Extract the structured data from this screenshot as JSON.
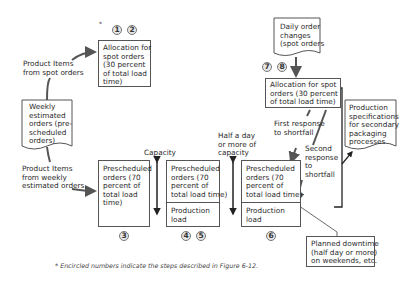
{
  "diagram": {
    "asterisk": "*",
    "steps": {
      "s1": "1",
      "s2": "2",
      "s3": "3",
      "s4": "4",
      "s5": "5",
      "s6": "6",
      "s7": "7",
      "s8": "8"
    },
    "alloc_left": "Allocation for\nspot orders\n(30 percent\nof total load\ntime)",
    "product_spot_label": "Product Items\nfrom spot orders",
    "weekly_doc": "Weekly\nestimated\norders (pre-\nscheduled\norders)",
    "product_weekly_label": "Product Items\nfrom weekly\nestimated orders.",
    "box3": "Prescheduled\norders (70\npercent of\ntotal load\ntime)",
    "capacity_label": "Capacity",
    "box45_top": "Prescheduled\norders (70\npercent of\ntotal load time)",
    "box45_bottom": "Production\nload",
    "half_day_label": "Half a day\nor more of\ncapacity",
    "box6_top": "Prescheduled\norders (70\npercent of\ntotal load time)",
    "box6_bottom": "Production\nload",
    "daily_doc": "Daily order\nchanges\n(spot orders",
    "alloc_right": "Allocation for spot\norders (30 percent\nof total load time)",
    "first_response": "First response\nto shortfall",
    "second_response": "Second\nresponse\nto\nshortfall",
    "spec_doc": "Production\nspecifications\nfor secondary\npackaging\nprocesses",
    "downtime_box": "Planned downtime\n(half day or more)\non weekends, etc.",
    "footnote": "* Encircled numbers indicate the steps described in Figure 6-12."
  }
}
